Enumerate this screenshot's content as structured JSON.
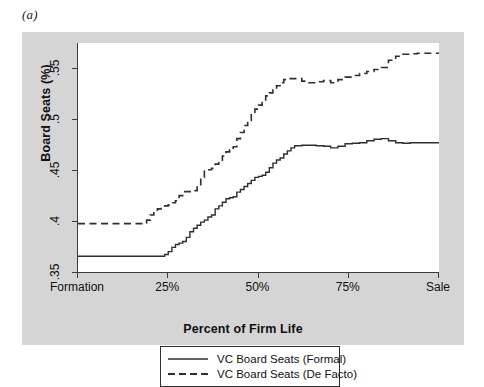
{
  "figure": {
    "panel_label": "(a)",
    "background_color": "#ffffff",
    "panel_color": "#d5d5d5",
    "plot_color": "#ffffff",
    "line_color": "#2e2e2e"
  },
  "axes": {
    "y_title": "Board Seats (%)",
    "x_title": "Percent of Firm Life",
    "y_ticks": [
      ".35",
      ".4",
      ".45",
      ".5",
      ".55"
    ],
    "x_ticks": [
      "Formation",
      "25%",
      "50%",
      "75%",
      "Sale"
    ]
  },
  "legend": {
    "items": [
      {
        "label": "VC Board Seats (Formal)",
        "style": "solid"
      },
      {
        "label": "VC Board Seats (De Facto)",
        "style": "dashed"
      }
    ]
  },
  "chart_data": {
    "type": "line",
    "title": "(a)",
    "xlabel": "Percent of Firm Life",
    "ylabel": "Board Seats (%)",
    "xlim": [
      0,
      100
    ],
    "ylim": [
      0.35,
      0.575
    ],
    "x_tick_values": [
      0,
      25,
      50,
      75,
      100
    ],
    "x_tick_labels": [
      "Formation",
      "25%",
      "50%",
      "75%",
      "Sale"
    ],
    "y_tick_values": [
      0.35,
      0.4,
      0.45,
      0.5,
      0.55
    ],
    "y_tick_labels": [
      ".35",
      ".4",
      ".45",
      ".5",
      ".55"
    ],
    "grid": false,
    "legend_position": "below-axes",
    "step_plot": true,
    "series": [
      {
        "name": "VC Board Seats (Formal)",
        "style": "solid",
        "color": "#2e2e2e",
        "x": [
          0,
          2,
          4,
          6,
          8,
          10,
          12,
          14,
          16,
          18,
          20,
          22,
          24,
          25,
          26,
          27,
          28,
          29,
          30,
          31,
          32,
          33,
          34,
          35,
          36,
          37,
          38,
          39,
          40,
          41,
          42,
          43,
          44,
          45,
          46,
          47,
          48,
          49,
          50,
          51,
          52,
          53,
          54,
          55,
          56,
          57,
          58,
          59,
          60,
          62,
          64,
          66,
          68,
          70,
          72,
          74,
          76,
          78,
          80,
          82,
          84,
          86,
          88,
          90,
          92,
          94,
          96,
          98,
          100
        ],
        "y": [
          0.3655,
          0.3655,
          0.3655,
          0.3655,
          0.3655,
          0.3655,
          0.3655,
          0.3655,
          0.3655,
          0.3655,
          0.3655,
          0.3655,
          0.3672,
          0.37,
          0.3742,
          0.377,
          0.3784,
          0.38,
          0.384,
          0.3895,
          0.393,
          0.396,
          0.399,
          0.401,
          0.404,
          0.406,
          0.412,
          0.415,
          0.4185,
          0.422,
          0.423,
          0.424,
          0.4285,
          0.431,
          0.434,
          0.437,
          0.44,
          0.443,
          0.444,
          0.445,
          0.448,
          0.4525,
          0.457,
          0.46,
          0.462,
          0.466,
          0.469,
          0.472,
          0.474,
          0.4745,
          0.4745,
          0.474,
          0.4735,
          0.472,
          0.4735,
          0.476,
          0.4765,
          0.477,
          0.479,
          0.4805,
          0.481,
          0.479,
          0.477,
          0.4765,
          0.477,
          0.477,
          0.477,
          0.477,
          0.477
        ]
      },
      {
        "name": "VC Board Seats (De Facto)",
        "style": "dashed",
        "color": "#2e2e2e",
        "x": [
          0,
          2,
          4,
          6,
          8,
          10,
          12,
          14,
          16,
          18,
          19,
          20,
          21,
          22,
          23,
          24,
          25,
          26,
          27,
          28,
          29,
          30,
          31,
          32,
          33,
          34,
          35,
          36,
          37,
          38,
          39,
          40,
          41,
          42,
          43,
          44,
          45,
          46,
          47,
          48,
          49,
          50,
          51,
          52,
          53,
          54,
          55,
          56,
          57,
          58,
          60,
          62,
          64,
          66,
          68,
          70,
          72,
          74,
          76,
          78,
          80,
          82,
          84,
          86,
          88,
          90,
          92,
          94,
          96,
          98,
          100
        ],
        "y": [
          0.3975,
          0.3975,
          0.3975,
          0.3975,
          0.3975,
          0.3975,
          0.3975,
          0.3975,
          0.3975,
          0.398,
          0.401,
          0.406,
          0.409,
          0.412,
          0.4135,
          0.415,
          0.416,
          0.418,
          0.42,
          0.425,
          0.429,
          0.429,
          0.429,
          0.43,
          0.435,
          0.443,
          0.45,
          0.4505,
          0.452,
          0.456,
          0.459,
          0.464,
          0.468,
          0.47,
          0.473,
          0.481,
          0.487,
          0.494,
          0.499,
          0.506,
          0.51,
          0.514,
          0.519,
          0.523,
          0.526,
          0.529,
          0.533,
          0.536,
          0.539,
          0.54,
          0.54,
          0.5375,
          0.536,
          0.537,
          0.538,
          0.536,
          0.539,
          0.5415,
          0.543,
          0.545,
          0.547,
          0.549,
          0.551,
          0.558,
          0.562,
          0.564,
          0.5645,
          0.565,
          0.565,
          0.565,
          0.565
        ]
      }
    ]
  }
}
